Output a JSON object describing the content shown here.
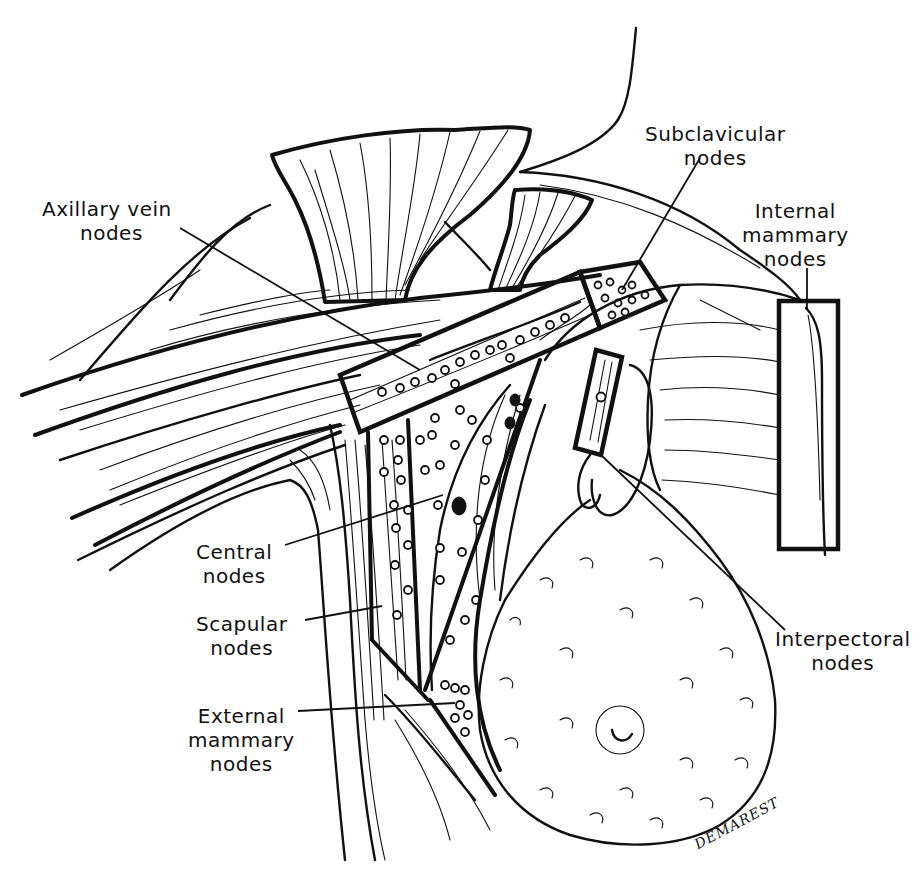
{
  "figure": {
    "labels": {
      "axillary_vein": {
        "line1": "Axillary vein",
        "line2": "nodes"
      },
      "subclavicular": {
        "line1": "Subclavicular",
        "line2": "nodes"
      },
      "internal_mammary": {
        "line1": "Internal",
        "line2": "mammary",
        "line3": "nodes"
      },
      "central": {
        "line1": "Central",
        "line2": "nodes"
      },
      "scapular": {
        "line1": "Scapular",
        "line2": "nodes"
      },
      "external_mammary": {
        "line1": "External",
        "line2": "mammary",
        "line3": "nodes"
      },
      "interpectoral": {
        "line1": "Interpectoral",
        "line2": "nodes"
      }
    },
    "signature": "DEMAREST",
    "colors": {
      "ink": "#111111",
      "background": "#ffffff"
    }
  }
}
